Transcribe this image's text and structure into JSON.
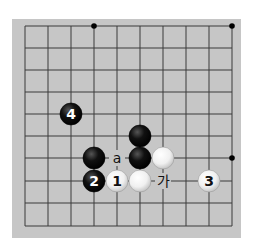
{
  "board": {
    "background": "#c6c6c6",
    "line_color": "#3a3a3a",
    "columns_x": [
      25,
      48,
      71,
      94,
      117,
      140,
      163,
      186,
      209,
      232
    ],
    "rows_y": [
      26,
      48,
      70,
      92,
      114,
      136,
      158,
      181,
      203,
      226
    ],
    "star_points": [
      {
        "col": 3,
        "row": 0
      },
      {
        "col": 9,
        "row": 0
      },
      {
        "col": 9,
        "row": 6
      }
    ]
  },
  "stones": [
    {
      "color": "black",
      "col": 2,
      "row": 4,
      "label": "4"
    },
    {
      "color": "black",
      "col": 5,
      "row": 5,
      "label": ""
    },
    {
      "color": "black",
      "col": 3,
      "row": 6,
      "label": ""
    },
    {
      "color": "black",
      "col": 5,
      "row": 6,
      "label": ""
    },
    {
      "color": "white",
      "col": 6,
      "row": 6,
      "label": ""
    },
    {
      "color": "black",
      "col": 3,
      "row": 7,
      "label": "2"
    },
    {
      "color": "white",
      "col": 4,
      "row": 7,
      "label": "1"
    },
    {
      "color": "white",
      "col": 5,
      "row": 7,
      "label": ""
    },
    {
      "color": "white",
      "col": 8,
      "row": 7,
      "label": "3"
    }
  ],
  "markers": [
    {
      "col": 4,
      "row": 6,
      "text": "a"
    },
    {
      "col": 6,
      "row": 7,
      "text": "가"
    }
  ]
}
